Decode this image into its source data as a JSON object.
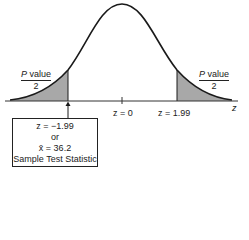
{
  "figure": {
    "type": "normal-distribution-two-tailed",
    "axis_label": "z",
    "center_label": "z = 0",
    "right_critical_label": "z = 1.99",
    "left_tail_label": {
      "numerator": "P value",
      "denominator": "2"
    },
    "right_tail_label": {
      "numerator": "P value",
      "denominator": "2"
    },
    "test_statistic_box": {
      "line1": "z = −1.99",
      "line2": "or",
      "line3": "x̄ = 36.2",
      "line4": "Sample Test Statistic"
    },
    "colors": {
      "curve": "#1a1a1a",
      "shade": "#a8a8a8",
      "axis": "#333333"
    }
  }
}
